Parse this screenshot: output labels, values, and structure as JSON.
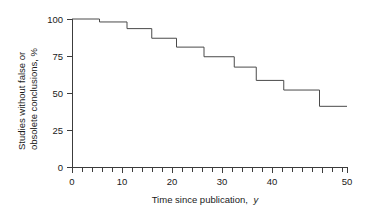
{
  "chart_data": {
    "type": "line",
    "subtype": "step-post",
    "title": "",
    "xlabel": "Time since publication, y",
    "ylabel": "Studies without false or obsolete conclusions, %",
    "xlim": [
      0,
      50
    ],
    "ylim": [
      0,
      100
    ],
    "grid": false,
    "legend": false,
    "legend_position": "none",
    "xticks_major": [
      0,
      10,
      20,
      30,
      40,
      50
    ],
    "xtick_labels": [
      "0",
      "10",
      "20",
      "30",
      "40",
      "50"
    ],
    "xticks_minor_interval": 2,
    "yticks_major": [
      0,
      25,
      50,
      75,
      100
    ],
    "ytick_labels": [
      "0",
      "25",
      "50",
      "75",
      "100"
    ],
    "line_color": "#4a4a4a",
    "axis_color": "#3c3c3c",
    "background_color": "#ffffff",
    "x": [
      0,
      5,
      5,
      10,
      10,
      14.5,
      14.5,
      19,
      19,
      24,
      24,
      29.5,
      29.5,
      33.5,
      33.5,
      38.5,
      38.5,
      45,
      45,
      50
    ],
    "y": [
      100,
      100,
      98,
      98,
      93.5,
      93.5,
      87,
      87,
      81,
      81,
      74.5,
      74.5,
      67.5,
      67.5,
      58.5,
      58.5,
      52,
      52,
      41,
      41
    ],
    "steps": [
      {
        "x_start": 0,
        "x_end": 5,
        "value": 100
      },
      {
        "x_start": 5,
        "x_end": 10,
        "value": 98
      },
      {
        "x_start": 10,
        "x_end": 14.5,
        "value": 93.5
      },
      {
        "x_start": 14.5,
        "x_end": 19,
        "value": 87
      },
      {
        "x_start": 19,
        "x_end": 24,
        "value": 81
      },
      {
        "x_start": 24,
        "x_end": 29.5,
        "value": 74.5
      },
      {
        "x_start": 29.5,
        "x_end": 33.5,
        "value": 67.5
      },
      {
        "x_start": 33.5,
        "x_end": 38.5,
        "value": 58.5
      },
      {
        "x_start": 38.5,
        "x_end": 45,
        "value": 52
      },
      {
        "x_start": 45,
        "x_end": 50,
        "value": 41
      }
    ],
    "xlabel_parts": {
      "text": "Time since publication,",
      "italic_symbol": "y"
    }
  }
}
